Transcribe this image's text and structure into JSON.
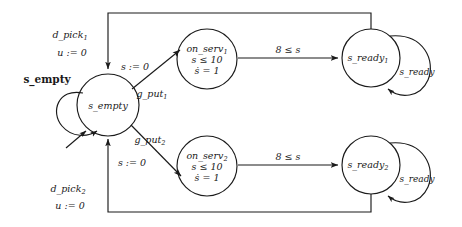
{
  "diagram": {
    "background": "#ffffff",
    "stroke_color": "#1a1a1a"
  },
  "states": {
    "s_empty": {
      "name": "s_empty",
      "outer_label": "s_empty",
      "cx": 108,
      "cy": 105,
      "r": 31
    },
    "on_serv_1": {
      "name": "on_serv",
      "subscript": "1",
      "invariant": "s ≤ 10",
      "flow": "ṡ = 1",
      "cx": 207,
      "cy": 59,
      "r": 30
    },
    "on_serv_2": {
      "name": "on_serv",
      "subscript": "2",
      "invariant": "s ≤ 10",
      "flow": "ṡ = 1",
      "cx": 207,
      "cy": 166,
      "r": 30
    },
    "s_ready_1": {
      "name": "s_ready",
      "subscript": "1",
      "loop_label": "s_ready",
      "cx": 371,
      "cy": 58,
      "r": 29
    },
    "s_ready_2": {
      "name": "s_ready",
      "subscript": "2",
      "loop_label": "s_ready",
      "cx": 371,
      "cy": 165,
      "r": 29
    }
  },
  "transitions": {
    "d_pick_1": {
      "event": "d_pick",
      "subscript": "1",
      "action": "u := 0"
    },
    "d_pick_2": {
      "event": "d_pick",
      "subscript": "2",
      "action": "u := 0"
    },
    "g_put_1": {
      "event": "g_put",
      "subscript": "1",
      "action": "s := 0"
    },
    "g_put_2": {
      "event": "g_put",
      "subscript": "2",
      "action": "s := 0"
    },
    "guard_1": {
      "guard": "8 ≤ s"
    },
    "guard_2": {
      "guard": "8 ≤ s"
    }
  }
}
